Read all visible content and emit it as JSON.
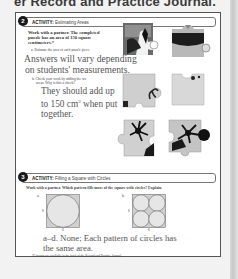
{
  "header": {
    "title": "er Record and Practice Journal."
  },
  "activity2": {
    "number": "2",
    "label_prefix": "ACTIVITY:",
    "label_title": " Estimating Areas",
    "prompt_line1": "Work with a partner. The completed",
    "prompt_line2": "puzzle has an area of 150 square",
    "prompt_line3": "centimeters.*",
    "part_a": "a.  Estimate the area of each puzzle piece.",
    "answer_a_line1": "Answers will vary depending",
    "answer_a_line2": "on students' measurements.",
    "part_b_line1": "b.  Check your work by adding the six",
    "part_b_line2": "areas. Why is this a check?",
    "answer_b_line1": "They should add up",
    "answer_b_line2": "to 150 cm",
    "answer_b_sup": "2",
    "answer_b_line2_end": " when put",
    "answer_b_line3": "together."
  },
  "activity3": {
    "number": "3",
    "label_prefix": "ACTIVITY:",
    "label_title": " Filling a Square with Circles",
    "prompt": "Work with a partner. Which pattern fills more of the square with circles? Explain.",
    "figure_a": {
      "label": "a.",
      "side_label": "6",
      "bottom_label": "6"
    },
    "figure_b": {
      "label": "b.",
      "side_label": "6",
      "bottom_label": "6"
    },
    "answer_line1": "a–d. None; Each pattern of circles has",
    "answer_line2": "the same area.",
    "footnote": "*Cut-outs are available in the back of the Record and Practice Journal."
  },
  "colors": {
    "answer_text": "#555555",
    "panel_border": "#555555",
    "badge": "#1a1a1a",
    "circle_fill": "#e4e4e4",
    "square_fill": "#d0d0d0"
  }
}
